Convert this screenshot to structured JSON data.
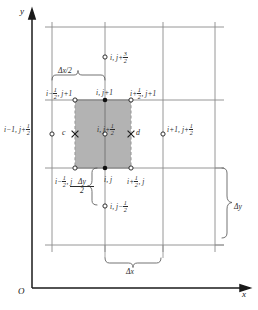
{
  "figure": {
    "kind": "staggered-grid-finite-difference-stencil",
    "axes": {
      "x_label": "x",
      "y_label": "y",
      "origin_label": "O"
    },
    "colors": {
      "gridline": "#8a8a8a",
      "axis": "#1a1a1a",
      "shaded_cell_fill": "#b3b3b3",
      "dashed_edge": "#9a9a9a",
      "marker_stroke": "#1a1a1a",
      "label_text": "#2a2a2a"
    },
    "node_labels": {
      "top_center": {
        "main": "i, j+",
        "frac_num": "3",
        "frac_den": "2"
      },
      "top_left": {
        "main_a": "i−",
        "frac_num": "1",
        "frac_den": "2",
        "main_b": ", j+1"
      },
      "top_mid": {
        "main": "i, j+1"
      },
      "top_right": {
        "main_a": "i+",
        "frac_num": "1",
        "frac_den": "2",
        "main_b": ", j+1"
      },
      "left_outer": {
        "main_a": "i−1, j+",
        "frac_num": "1",
        "frac_den": "2"
      },
      "center": {
        "main_a": "i, j+",
        "frac_num": "1",
        "frac_den": "2"
      },
      "right_outer": {
        "main_a": "i+1, j+",
        "frac_num": "1",
        "frac_den": "2"
      },
      "bottom_left": {
        "main_a": "i−",
        "frac_num": "1",
        "frac_den": "2",
        "main_b": ", j"
      },
      "bottom_mid": {
        "main": "i, j"
      },
      "bottom_right": {
        "main_a": "i+",
        "frac_num": "1",
        "frac_den": "2",
        "main_b": ", j"
      },
      "below_center": {
        "main_a": "i, j−",
        "frac_num": "1",
        "frac_den": "2"
      },
      "point_c": "c",
      "point_d": "d"
    },
    "dimensions": {
      "dx_half": "Δx/2",
      "dy_half_num": "Δy",
      "dy_half_den": "2",
      "dx": "Δx",
      "dy": "Δy"
    }
  }
}
